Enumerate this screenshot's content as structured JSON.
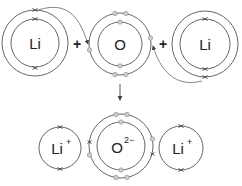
{
  "diagram": {
    "title": "",
    "reactants": {
      "left_atom": {
        "symbol": "Li"
      },
      "center_atom": {
        "symbol": "O"
      },
      "right_atom": {
        "symbol": "Li"
      },
      "plus_left": "+",
      "plus_right": "+"
    },
    "products": {
      "left_ion": {
        "symbol": "Li",
        "charge": "+"
      },
      "center_ion": {
        "symbol": "O",
        "charge": "2−"
      },
      "right_ion": {
        "symbol": "Li",
        "charge": "+"
      }
    },
    "legend": {
      "cross": "lithium electron",
      "dot": "oxygen electron"
    },
    "colors": {
      "shell_stroke": "#555555",
      "dot_fill": "#cfcfcf",
      "cross_stroke": "#444444"
    }
  }
}
